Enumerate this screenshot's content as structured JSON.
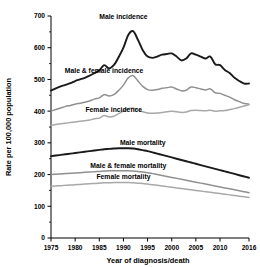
{
  "chart_data": {
    "type": "line",
    "title": "",
    "xlabel": "Year of diagnosis/death",
    "ylabel": "Rate per 100,000 population",
    "xlim": [
      1975,
      2016
    ],
    "ylim": [
      0,
      700
    ],
    "grid": false,
    "legend_position": "inline-annotations",
    "xticks": [
      1975,
      1980,
      1985,
      1990,
      1995,
      2000,
      2005,
      2010,
      2016
    ],
    "xtick_labels": [
      "1975",
      "1980",
      "1985",
      "1990",
      "1995",
      "2000",
      "2005",
      "2010",
      "2016"
    ],
    "yticks": [
      0,
      100,
      200,
      300,
      400,
      500,
      600,
      700
    ],
    "ytick_labels": [
      "0",
      "100",
      "200",
      "300",
      "400",
      "500",
      "600",
      "700"
    ],
    "yminor_ticks": [
      50,
      150,
      250,
      350,
      450,
      550,
      650
    ],
    "x": [
      1975,
      1976,
      1977,
      1978,
      1979,
      1980,
      1981,
      1982,
      1983,
      1984,
      1985,
      1986,
      1987,
      1988,
      1989,
      1990,
      1991,
      1992,
      1993,
      1994,
      1995,
      1996,
      1997,
      1998,
      1999,
      2000,
      2001,
      2002,
      2003,
      2004,
      2005,
      2006,
      2007,
      2008,
      2009,
      2010,
      2011,
      2012,
      2013,
      2014,
      2015,
      2016
    ],
    "series": [
      {
        "name": "Male incidence",
        "color": "#1a1a1a",
        "width": 1.9,
        "label_x": 1990,
        "label_y": 690,
        "values": [
          465,
          472,
          478,
          483,
          488,
          495,
          500,
          505,
          512,
          520,
          528,
          545,
          535,
          545,
          570,
          600,
          640,
          652,
          625,
          592,
          572,
          568,
          572,
          578,
          580,
          582,
          572,
          560,
          566,
          582,
          578,
          572,
          566,
          572,
          548,
          545,
          530,
          520,
          505,
          495,
          487,
          487
        ]
      },
      {
        "name": "Male & female incidence",
        "color": "#909090",
        "width": 1.5,
        "label_x": 1986,
        "label_y": 520,
        "values": [
          400,
          405,
          410,
          415,
          418,
          422,
          425,
          428,
          432,
          438,
          442,
          452,
          448,
          452,
          465,
          482,
          505,
          512,
          495,
          478,
          468,
          466,
          468,
          472,
          474,
          476,
          470,
          464,
          466,
          476,
          474,
          470,
          467,
          470,
          458,
          456,
          450,
          444,
          436,
          430,
          424,
          422
        ]
      },
      {
        "name": "Female incidence",
        "color": "#a8a8a8",
        "width": 1.5,
        "label_x": 1988,
        "label_y": 398,
        "values": [
          355,
          358,
          360,
          362,
          364,
          366,
          368,
          370,
          372,
          376,
          378,
          386,
          382,
          384,
          392,
          400,
          408,
          410,
          404,
          398,
          394,
          393,
          394,
          396,
          398,
          400,
          398,
          396,
          397,
          402,
          403,
          402,
          401,
          403,
          400,
          401,
          402,
          405,
          408,
          412,
          416,
          420
        ]
      },
      {
        "name": "Male mortality",
        "color": "#1a1a1a",
        "width": 1.9,
        "label_x": 1994,
        "label_y": 292,
        "values": [
          258,
          260,
          262,
          264,
          266,
          268,
          270,
          272,
          274,
          276,
          278,
          280,
          281,
          282,
          283,
          283,
          283,
          282,
          280,
          277,
          274,
          270,
          266,
          262,
          258,
          254,
          250,
          246,
          242,
          238,
          234,
          230,
          226,
          222,
          218,
          214,
          210,
          206,
          202,
          198,
          194,
          190
        ]
      },
      {
        "name": "Male & female mortality",
        "color": "#909090",
        "width": 1.5,
        "label_x": 1991,
        "label_y": 222,
        "values": [
          200,
          201,
          202,
          203,
          204,
          205,
          206,
          207,
          208,
          209,
          210,
          211,
          212,
          212,
          212,
          212,
          212,
          211,
          210,
          208,
          206,
          203,
          200,
          197,
          194,
          191,
          188,
          185,
          182,
          179,
          176,
          173,
          170,
          167,
          164,
          161,
          158,
          155,
          152,
          149,
          146,
          143
        ]
      },
      {
        "name": "Female mortality",
        "color": "#a8a8a8",
        "width": 1.5,
        "label_x": 1990,
        "label_y": 186,
        "values": [
          163,
          164,
          165,
          166,
          167,
          168,
          169,
          170,
          171,
          172,
          173,
          174,
          174,
          175,
          175,
          175,
          175,
          174,
          173,
          172,
          170,
          168,
          166,
          164,
          162,
          160,
          158,
          156,
          154,
          152,
          150,
          148,
          146,
          144,
          142,
          140,
          138,
          136,
          134,
          132,
          130,
          128
        ]
      }
    ]
  }
}
